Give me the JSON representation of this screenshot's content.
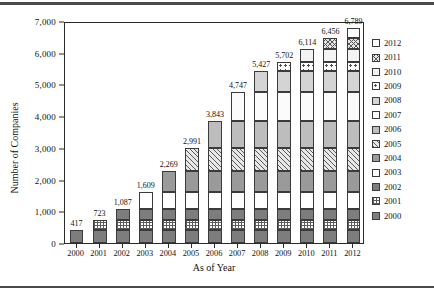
{
  "chart_data": {
    "type": "bar",
    "subtype": "stacked-bar",
    "title": "",
    "xlabel": "As of Year",
    "ylabel": "Number of Companies",
    "categories": [
      "2000",
      "2001",
      "2002",
      "2003",
      "2004",
      "2005",
      "2006",
      "2007",
      "2008",
      "2009",
      "2010",
      "2011",
      "2012"
    ],
    "totals": [
      417,
      723,
      1087,
      1609,
      2269,
      2991,
      3843,
      4747,
      5427,
      5702,
      6114,
      6456,
      6789
    ],
    "total_labels": [
      "417",
      "723",
      "1,087",
      "1,609",
      "2,269",
      "2,991",
      "3,843",
      "4,747",
      "5,427",
      "5,702",
      "6,114",
      "6,456",
      "6,789"
    ],
    "ylim": [
      0,
      7000
    ],
    "ytick_values": [
      0,
      1000,
      2000,
      3000,
      4000,
      5000,
      6000,
      7000
    ],
    "ytick_labels": [
      "0",
      "1,000",
      "2,000",
      "3,000",
      "4,000",
      "5,000",
      "6,000",
      "7,000"
    ],
    "grid": false,
    "legend_position": "right",
    "legend_entries": [
      {
        "label": "2012",
        "pattern": "p-white"
      },
      {
        "label": "2011",
        "pattern": "p-cross"
      },
      {
        "label": "2010",
        "pattern": "p-offwhite"
      },
      {
        "label": "2009",
        "pattern": "p-dot-big"
      },
      {
        "label": "2008",
        "pattern": "p-solid-vlight"
      },
      {
        "label": "2007",
        "pattern": "p-dot-sm"
      },
      {
        "label": "2006",
        "pattern": "p-solid-light"
      },
      {
        "label": "2005",
        "pattern": "p-diag"
      },
      {
        "label": "2004",
        "pattern": "p-solid-mid"
      },
      {
        "label": "2003",
        "pattern": "p-white"
      },
      {
        "label": "2002",
        "pattern": "p-solid-dark"
      },
      {
        "label": "2001",
        "pattern": "p-grid"
      },
      {
        "label": "2000",
        "pattern": "p-solid-dark"
      }
    ],
    "series": [
      {
        "name": "2000",
        "pattern": "p-solid-dark",
        "values": [
          417,
          417,
          417,
          417,
          417,
          417,
          417,
          417,
          417,
          417,
          417,
          417,
          417
        ]
      },
      {
        "name": "2001",
        "pattern": "p-grid",
        "values": [
          0,
          306,
          306,
          306,
          306,
          306,
          306,
          306,
          306,
          306,
          306,
          306,
          306
        ]
      },
      {
        "name": "2002",
        "pattern": "p-solid-dark",
        "values": [
          0,
          0,
          364,
          364,
          364,
          364,
          364,
          364,
          364,
          364,
          364,
          364,
          364
        ]
      },
      {
        "name": "2003",
        "pattern": "p-white",
        "values": [
          0,
          0,
          0,
          522,
          522,
          522,
          522,
          522,
          522,
          522,
          522,
          522,
          522
        ]
      },
      {
        "name": "2004",
        "pattern": "p-solid-mid",
        "values": [
          0,
          0,
          0,
          0,
          660,
          660,
          660,
          660,
          660,
          660,
          660,
          660,
          660
        ]
      },
      {
        "name": "2005",
        "pattern": "p-diag",
        "values": [
          0,
          0,
          0,
          0,
          0,
          722,
          722,
          722,
          722,
          722,
          722,
          722,
          722
        ]
      },
      {
        "name": "2006",
        "pattern": "p-solid-light",
        "values": [
          0,
          0,
          0,
          0,
          0,
          0,
          852,
          852,
          852,
          852,
          852,
          852,
          852
        ]
      },
      {
        "name": "2007",
        "pattern": "p-dot-sm",
        "values": [
          0,
          0,
          0,
          0,
          0,
          0,
          0,
          904,
          904,
          904,
          904,
          904,
          904
        ]
      },
      {
        "name": "2008",
        "pattern": "p-solid-vlight",
        "values": [
          0,
          0,
          0,
          0,
          0,
          0,
          0,
          0,
          680,
          680,
          680,
          680,
          680
        ]
      },
      {
        "name": "2009",
        "pattern": "p-dot-big",
        "values": [
          0,
          0,
          0,
          0,
          0,
          0,
          0,
          0,
          0,
          275,
          275,
          275,
          275
        ]
      },
      {
        "name": "2010",
        "pattern": "p-offwhite",
        "values": [
          0,
          0,
          0,
          0,
          0,
          0,
          0,
          0,
          0,
          0,
          412,
          412,
          412
        ]
      },
      {
        "name": "2011",
        "pattern": "p-cross",
        "values": [
          0,
          0,
          0,
          0,
          0,
          0,
          0,
          0,
          0,
          0,
          0,
          342,
          342
        ]
      },
      {
        "name": "2012",
        "pattern": "p-white",
        "values": [
          0,
          0,
          0,
          0,
          0,
          0,
          0,
          0,
          0,
          0,
          0,
          0,
          333
        ]
      }
    ]
  }
}
